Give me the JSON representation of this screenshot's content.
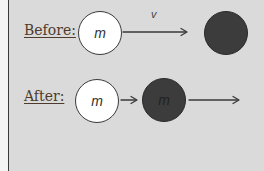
{
  "diagram": {
    "before": {
      "label": "Before:",
      "ball1": {
        "mass_label": "m",
        "color": "#ffffff"
      },
      "arrow_label": "v",
      "ball2": {
        "mass_label": "",
        "color": "#3c3c3c"
      }
    },
    "after": {
      "label": "After:",
      "ball1": {
        "mass_label": "m",
        "color": "#ffffff"
      },
      "ball2": {
        "mass_label": "m",
        "color": "#3c3c3c"
      }
    },
    "colors": {
      "background": "#dadada",
      "label_text": "#4e3b2c",
      "arrow": "#3a3a3a"
    }
  }
}
